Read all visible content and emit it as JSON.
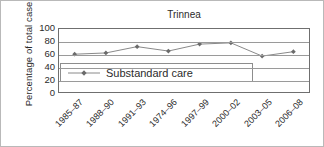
{
  "chart_data": {
    "type": "line",
    "title": "Trinnea",
    "xlabel": "",
    "ylabel": "Percentage of total cases",
    "ylim": [
      0,
      100
    ],
    "yticks": [
      100,
      80,
      60,
      40,
      20,
      0
    ],
    "grid": true,
    "legend_position": "inside-left-middle",
    "categories": [
      "1985–87",
      "1988–90",
      "1991–93",
      "1974–96",
      "1997–99",
      "2000–02",
      "2003–05",
      "2006–08"
    ],
    "series": [
      {
        "name": "Substandard care",
        "values": [
          60,
          62,
          72,
          65,
          76,
          78,
          57,
          64
        ],
        "color": "#8a8a8a",
        "marker": "diamond"
      }
    ]
  },
  "legend": {
    "entries": [
      {
        "label": "Substandard care",
        "swatch": "line-marker-swatch"
      }
    ]
  },
  "colors": {
    "line": "#8a8a8a",
    "marker": "#6b6b6b",
    "grid": "#9a9a9a",
    "frame": "#6f6f6f",
    "text": "#2b2b2b",
    "background": "#ffffff"
  }
}
